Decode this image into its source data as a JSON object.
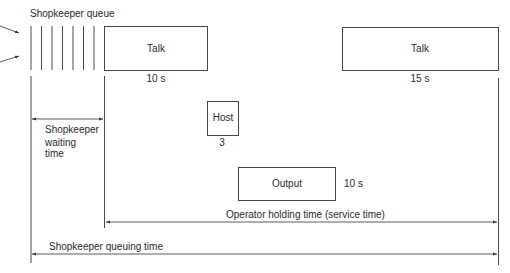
{
  "diagram": {
    "queue_label": "Shopkeeper queue",
    "queue_line_count": 7,
    "boxes": [
      {
        "id": "talk-1",
        "label": "Talk",
        "duration": "10 s"
      },
      {
        "id": "host",
        "label": "Host",
        "duration": "3"
      },
      {
        "id": "output",
        "label": "Output",
        "duration": "10 s"
      },
      {
        "id": "talk-2",
        "label": "Talk",
        "duration": "15 s"
      }
    ],
    "intervals": {
      "waiting": "Shopkeeper waiting time",
      "waiting_lines": [
        "Shopkeeper",
        "waiting",
        "time"
      ],
      "holding": "Operator holding time (service time)",
      "queuing": "Shopkeeper queuing time"
    },
    "colors": {
      "stroke": "#333333",
      "text": "#2a2a2a",
      "background": "#ffffff"
    }
  }
}
